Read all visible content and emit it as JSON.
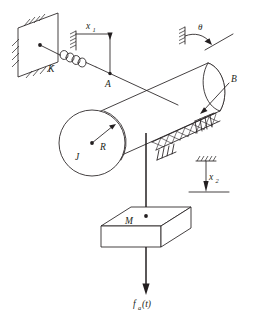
{
  "figure": {
    "type": "engineering-schematic",
    "background_color": "#ffffff",
    "line_color": "#231f20"
  },
  "labels": {
    "spring": "K",
    "displacement_input": "x",
    "displacement_input_sub": "1",
    "point_a": "A",
    "rotation": "θ",
    "damper": "B",
    "inertia": "J",
    "radius": "R",
    "mass": "M",
    "displacement_output": "x",
    "displacement_output_sub": "2",
    "applied_force": "f",
    "applied_force_sub": "a",
    "applied_force_arg": "(t)"
  },
  "components": [
    {
      "name": "fixed-wall",
      "label": "",
      "description": "hatched fixed support plate at upper left"
    },
    {
      "name": "spring",
      "label": "K",
      "description": "coil spring connecting wall to cable"
    },
    {
      "name": "cable-upper",
      "label": "",
      "description": "cable from spring to cylinder wrap"
    },
    {
      "name": "point-a",
      "label": "A",
      "description": "marked point on cable at x1 reference"
    },
    {
      "name": "x1-reference",
      "label": "x1",
      "description": "horizontal displacement reference with arrow"
    },
    {
      "name": "theta-reference",
      "label": "θ",
      "description": "angular rotation reference with curved arrow"
    },
    {
      "name": "cylinder",
      "label": "J, R",
      "description": "rotating drum of inertia J and radius R"
    },
    {
      "name": "damper-band",
      "label": "B",
      "description": "viscous damping element along cylinder base"
    },
    {
      "name": "cable-lower",
      "label": "",
      "description": "vertical cable from drum to mass"
    },
    {
      "name": "mass-block",
      "label": "M",
      "description": "translating mass block"
    },
    {
      "name": "x2-reference",
      "label": "x2",
      "description": "vertical displacement reference with arrow"
    },
    {
      "name": "force-arrow",
      "label": "f_a(t)",
      "description": "applied force acting downward on mass"
    }
  ]
}
